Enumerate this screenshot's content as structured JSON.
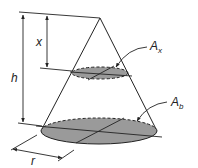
{
  "diagram": {
    "type": "cone-cross-section",
    "labels": {
      "height": "h",
      "depth": "x",
      "radius": "r",
      "section_area": "A",
      "section_area_sub": "x",
      "base_area": "A",
      "base_area_sub": "b"
    },
    "colors": {
      "stroke": "#222222",
      "fill": "#9a9a9a"
    }
  }
}
